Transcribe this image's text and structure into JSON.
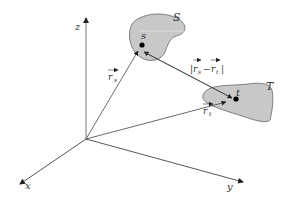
{
  "diagram": {
    "type": "3d-coordinate-vector-diagram",
    "axes": {
      "x": {
        "label": "x"
      },
      "y": {
        "label": "y"
      },
      "z": {
        "label": "z"
      }
    },
    "regions": [
      {
        "id": "S",
        "label": "S",
        "point_label": "s",
        "fill": "#c8c8c8"
      },
      {
        "id": "T",
        "label": "T",
        "point_label": "t",
        "fill": "#c8c8c8"
      }
    ],
    "vectors": [
      {
        "id": "r_s",
        "label_base": "r",
        "label_sub": "s",
        "from": "origin",
        "to": "s"
      },
      {
        "id": "r_t",
        "label_base": "r",
        "label_sub": "t",
        "from": "origin",
        "to": "t"
      },
      {
        "id": "diff",
        "label_text": "|r_s − r_t|",
        "label_left": "|",
        "label_a": "r",
        "label_a_sub": "s",
        "label_minus": "−",
        "label_b": "r",
        "label_b_sub": "t",
        "label_right": "|",
        "from": "t",
        "to": "s"
      }
    ],
    "colors": {
      "line": "#555555",
      "blob_fill": "#c8c8c8",
      "blob_stroke": "#666666",
      "point": "#000000"
    }
  }
}
